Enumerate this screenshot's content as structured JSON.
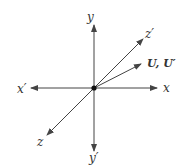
{
  "diagram": {
    "type": "coordinate-axes",
    "origin": {
      "x": 94,
      "y": 88
    },
    "colors": {
      "line": "#444444",
      "text": "#333333",
      "origin_dot": "#111111"
    },
    "axes": [
      {
        "name": "x",
        "label": "x",
        "end": {
          "x": 157,
          "y": 88
        },
        "label_pos": {
          "x": 163,
          "y": 92
        }
      },
      {
        "name": "x-prime",
        "label": "x′",
        "end": {
          "x": 31,
          "y": 88
        },
        "label_pos": {
          "x": 17,
          "y": 93
        }
      },
      {
        "name": "y",
        "label": "y",
        "end": {
          "x": 94,
          "y": 25
        },
        "label_pos": {
          "x": 87,
          "y": 21
        }
      },
      {
        "name": "y-prime",
        "label": "y′",
        "end": {
          "x": 94,
          "y": 151
        },
        "label_pos": {
          "x": 89,
          "y": 162
        }
      },
      {
        "name": "z",
        "label": "z",
        "end": {
          "x": 47,
          "y": 135
        },
        "label_pos": {
          "x": 37,
          "y": 146
        }
      },
      {
        "name": "z-prime",
        "label": "z′",
        "end": {
          "x": 143,
          "y": 39
        },
        "label_pos": {
          "x": 145,
          "y": 38
        }
      },
      {
        "name": "vector-u",
        "label": "U, U′",
        "end": {
          "x": 141,
          "y": 64
        },
        "label_pos": {
          "x": 147,
          "y": 67
        },
        "bold": true
      }
    ]
  }
}
